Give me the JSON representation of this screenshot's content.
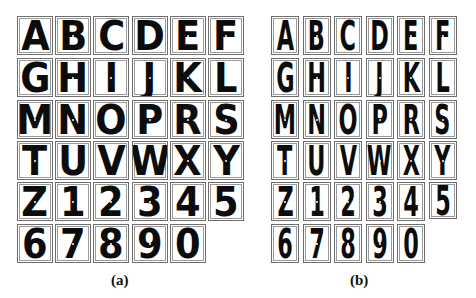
{
  "figure": {
    "panels": [
      {
        "id": "a",
        "caption": "(a)",
        "style": "wide stroke characters",
        "rows": [
          [
            "A",
            "B",
            "C",
            "D",
            "E",
            "F"
          ],
          [
            "G",
            "H",
            "I",
            "J",
            "K",
            "L"
          ],
          [
            "M",
            "N",
            "O",
            "P",
            "R",
            "S"
          ],
          [
            "T",
            "U",
            "V",
            "W",
            "X",
            "Y"
          ],
          [
            "Z",
            "1",
            "2",
            "3",
            "4",
            "5"
          ],
          [
            "6",
            "7",
            "8",
            "9",
            "0"
          ]
        ]
      },
      {
        "id": "b",
        "caption": "(b)",
        "style": "narrow condensed characters",
        "rows": [
          [
            "A",
            "B",
            "C",
            "D",
            "E",
            "F"
          ],
          [
            "G",
            "H",
            "I",
            "J",
            "K",
            "L"
          ],
          [
            "M",
            "N",
            "O",
            "P",
            "R",
            "S"
          ],
          [
            "T",
            "U",
            "V",
            "W",
            "X",
            "Y"
          ],
          [
            "Z",
            "1",
            "2",
            "3",
            "4",
            "5"
          ],
          [
            "6",
            "7",
            "8",
            "9",
            "0"
          ]
        ]
      }
    ]
  }
}
